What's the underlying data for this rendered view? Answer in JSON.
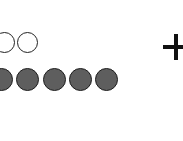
{
  "figure": {
    "background": "#ffffff",
    "rows": [
      {
        "name": "hollow-row",
        "style": "hollow",
        "count_visible": 2,
        "circles": [
          {
            "cx": 5,
            "cy": 42
          },
          {
            "cx": 28,
            "cy": 42
          }
        ]
      },
      {
        "name": "filled-row",
        "style": "filled",
        "fill_color": "#5e5e5e",
        "count_visible": 5,
        "circles": [
          {
            "cx": 2,
            "cy": 80
          },
          {
            "cx": 28,
            "cy": 80
          },
          {
            "cx": 55,
            "cy": 80
          },
          {
            "cx": 81,
            "cy": 80
          },
          {
            "cx": 107,
            "cy": 80
          }
        ]
      }
    ],
    "operator": {
      "symbol": "+",
      "cx": 176,
      "cy": 47,
      "color": "#111111"
    }
  }
}
